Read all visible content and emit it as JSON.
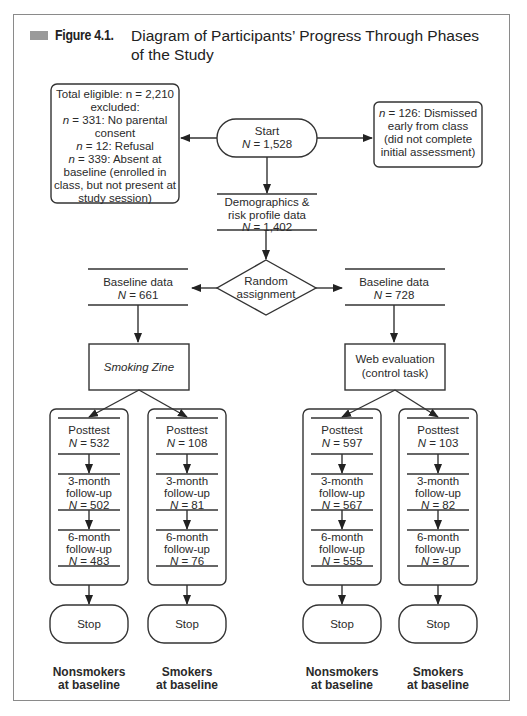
{
  "figure": {
    "label": "Figure 4.1.",
    "title_line1": "Diagram of Participants’ Progress Through Phases",
    "title_line2": "of the Study",
    "accent_color": "#9a9a9a"
  },
  "nodes": {
    "excluded": {
      "lines": [
        "Total eligible: n = 2,210",
        "excluded:",
        "n = 331: No parental",
        "consent",
        "n = 12: Refusal",
        "n = 339: Absent at",
        "baseline (enrolled in",
        "class, but not present at",
        "study session)"
      ]
    },
    "start": {
      "lines": [
        "Start",
        "N = 1,528"
      ]
    },
    "dismissed": {
      "lines": [
        "n = 126: Dismissed",
        "early from class",
        "(did not complete",
        "initial assessment)"
      ]
    },
    "demographics": {
      "lines": [
        "Demographics &",
        "risk profile data",
        "N = 1,402"
      ]
    },
    "random": {
      "lines": [
        "Random",
        "assignment"
      ]
    },
    "baseline_left": {
      "lines": [
        "Baseline data",
        "N = 661"
      ]
    },
    "baseline_right": {
      "lines": [
        "Baseline data",
        "N = 728"
      ]
    },
    "intervention": {
      "lines": [
        "Smoking Zine"
      ]
    },
    "control": {
      "lines": [
        "Web evaluation",
        "(control task)"
      ]
    }
  },
  "groups": [
    {
      "name": "Smoking Zine – Nonsmokers",
      "posttest": "N = 532",
      "m3": "N = 502",
      "m6": "N = 483",
      "stop": "Stop",
      "footer": [
        "Nonsmokers",
        "at baseline"
      ]
    },
    {
      "name": "Smoking Zine – Smokers",
      "posttest": "N = 108",
      "m3": "N = 81",
      "m6": "N = 76",
      "stop": "Stop",
      "footer": [
        "Smokers",
        "at baseline"
      ]
    },
    {
      "name": "Web evaluation – Nonsmokers",
      "posttest": "N = 597",
      "m3": "N = 567",
      "m6": "N = 555",
      "stop": "Stop",
      "footer": [
        "Nonsmokers",
        "at baseline"
      ]
    },
    {
      "name": "Web evaluation – Smokers",
      "posttest": "N = 103",
      "m3": "N = 82",
      "m6": "N = 87",
      "stop": "Stop",
      "footer": [
        "Smokers",
        "at baseline"
      ]
    }
  ],
  "phase_labels": {
    "posttest": "Posttest",
    "m3": [
      "3-month",
      "follow-up"
    ],
    "m6": [
      "6-month",
      "follow-up"
    ]
  }
}
